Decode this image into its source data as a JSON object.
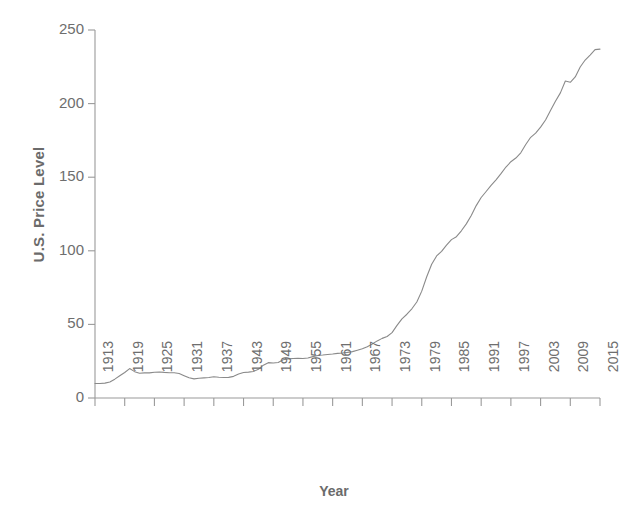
{
  "chart_data": {
    "type": "line",
    "title": "",
    "xlabel": "Year",
    "ylabel": "U.S. Price Level",
    "xlim": [
      1913,
      2015
    ],
    "ylim": [
      0,
      250
    ],
    "grid": false,
    "legend": "none",
    "line_color": "#8a8a8a",
    "axis_color": "#9a9a9a",
    "text_color": "#6e6e6e",
    "background_color": "#ffffff",
    "x_tick_labels": [
      "1913",
      "1919",
      "1925",
      "1931",
      "1937",
      "1943",
      "1949",
      "1955",
      "1961",
      "1967",
      "1973",
      "1979",
      "1985",
      "1991",
      "1997",
      "2003",
      "2009",
      "2015"
    ],
    "y_tick_labels": [
      "0",
      "50",
      "100",
      "150",
      "200",
      "250"
    ],
    "y_ticks": [
      0,
      50,
      100,
      150,
      200,
      250
    ],
    "series": [
      {
        "name": "U.S. Price Level",
        "x": [
          1913,
          1914,
          1915,
          1916,
          1917,
          1918,
          1919,
          1920,
          1921,
          1922,
          1923,
          1924,
          1925,
          1926,
          1927,
          1928,
          1929,
          1930,
          1931,
          1932,
          1933,
          1934,
          1935,
          1936,
          1937,
          1938,
          1939,
          1940,
          1941,
          1942,
          1943,
          1944,
          1945,
          1946,
          1947,
          1948,
          1949,
          1950,
          1951,
          1952,
          1953,
          1954,
          1955,
          1956,
          1957,
          1958,
          1959,
          1960,
          1961,
          1962,
          1963,
          1964,
          1965,
          1966,
          1967,
          1968,
          1969,
          1970,
          1971,
          1972,
          1973,
          1974,
          1975,
          1976,
          1977,
          1978,
          1979,
          1980,
          1981,
          1982,
          1983,
          1984,
          1985,
          1986,
          1987,
          1988,
          1989,
          1990,
          1991,
          1992,
          1993,
          1994,
          1995,
          1996,
          1997,
          1998,
          1999,
          2000,
          2001,
          2002,
          2003,
          2004,
          2005,
          2006,
          2007,
          2008,
          2009,
          2010,
          2011,
          2012,
          2013,
          2014,
          2015
        ],
        "y": [
          9.9,
          9.9,
          10.1,
          10.9,
          12.8,
          15.1,
          17.3,
          20.0,
          17.9,
          16.8,
          17.1,
          17.1,
          17.5,
          17.7,
          17.4,
          17.2,
          17.2,
          16.7,
          15.2,
          13.7,
          13.0,
          13.4,
          13.7,
          13.9,
          14.4,
          14.1,
          13.9,
          14.0,
          14.7,
          16.3,
          17.3,
          17.6,
          18.0,
          19.5,
          22.3,
          24.0,
          23.8,
          24.1,
          26.0,
          26.6,
          26.8,
          26.9,
          26.8,
          27.2,
          28.1,
          28.9,
          29.2,
          29.6,
          29.9,
          30.3,
          30.6,
          31.0,
          31.5,
          32.5,
          33.4,
          34.8,
          36.7,
          38.8,
          40.5,
          41.8,
          44.4,
          49.3,
          53.8,
          56.9,
          60.6,
          65.2,
          72.6,
          82.4,
          90.9,
          96.5,
          99.6,
          103.9,
          107.6,
          109.6,
          113.6,
          118.3,
          124.0,
          130.7,
          136.2,
          140.3,
          144.5,
          148.2,
          152.4,
          156.9,
          160.5,
          163.0,
          166.6,
          172.2,
          177.1,
          179.9,
          184.0,
          188.9,
          195.3,
          201.6,
          207.3,
          215.3,
          214.5,
          218.1,
          224.9,
          229.6,
          233.0,
          236.7,
          237.0
        ]
      }
    ],
    "annotations": [
      {
        "label": "post-WWI peak",
        "year": 1920,
        "value": 20.0
      },
      {
        "label": "Great Depression trough",
        "year": 1933,
        "value": 13.0
      },
      {
        "label": "Great Recession dip",
        "year": 2009,
        "value": 214.5
      },
      {
        "label": "end of series",
        "year": 2015,
        "value": 237.0
      }
    ]
  }
}
